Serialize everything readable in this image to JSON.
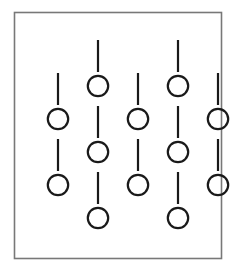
{
  "figure": {
    "canvas": {
      "width": 230,
      "height": 271,
      "background_color": "#ffffff"
    },
    "frame": {
      "label": "border-rectangle",
      "x": 14.5,
      "y": 12.5,
      "width": 207,
      "height": 246,
      "stroke_color": "#787878",
      "stroke_width": 1.6,
      "fill_color": "#ffffff"
    },
    "style": {
      "circle_stroke_color": "#1a1a1a",
      "circle_stroke_width": 2.2,
      "circle_fill_color": "none",
      "circle_radius": 10.2,
      "segment_stroke_color": "#1a1a1a",
      "segment_stroke_width": 2.2,
      "segment_length": 30
    },
    "layout": {
      "column_count": 5,
      "column_x": [
        58,
        98,
        138,
        178,
        58
      ],
      "column_spacing": 40,
      "row_spacing": 33,
      "tall_column_top_y": 40,
      "short_column_top_y": 73
    },
    "columns": [
      {
        "name": "column-1",
        "kind": "short",
        "x": 58,
        "circle_count": 2,
        "segment_count": 2,
        "circles_y": [
          119,
          185
        ],
        "segments": [
          {
            "y1": 73,
            "y2": 105
          },
          {
            "y1": 139,
            "y2": 171
          }
        ]
      },
      {
        "name": "column-2",
        "kind": "tall",
        "x": 98,
        "circle_count": 3,
        "segment_count": 3,
        "circles_y": [
          86,
          152,
          218
        ],
        "segments": [
          {
            "y1": 40,
            "y2": 72
          },
          {
            "y1": 106,
            "y2": 138
          },
          {
            "y1": 172,
            "y2": 204
          }
        ]
      },
      {
        "name": "column-3",
        "kind": "short",
        "x": 138,
        "circle_count": 2,
        "segment_count": 2,
        "circles_y": [
          119,
          185
        ],
        "segments": [
          {
            "y1": 73,
            "y2": 105
          },
          {
            "y1": 139,
            "y2": 171
          }
        ]
      },
      {
        "name": "column-4",
        "kind": "tall",
        "x": 178,
        "circle_count": 3,
        "segment_count": 3,
        "circles_y": [
          86,
          152,
          218
        ],
        "segments": [
          {
            "y1": 40,
            "y2": 72
          },
          {
            "y1": 106,
            "y2": 138
          },
          {
            "y1": 172,
            "y2": 204
          }
        ]
      },
      {
        "name": "column-5",
        "kind": "short",
        "x": 218,
        "circle_count": 2,
        "segment_count": 2,
        "circles_y": [
          119,
          185
        ],
        "segments": [
          {
            "y1": 73,
            "y2": 105
          },
          {
            "y1": 139,
            "y2": 171
          }
        ]
      }
    ],
    "totals": {
      "circles": 12,
      "segments": 12
    }
  }
}
